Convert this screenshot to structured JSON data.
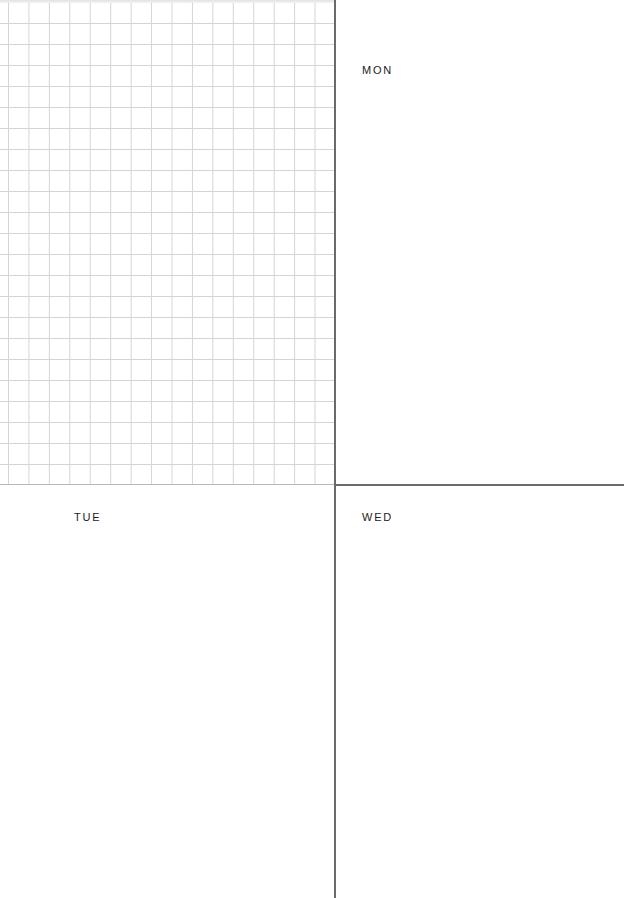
{
  "planner": {
    "notes_grid": {
      "columns": 16,
      "rows": 23,
      "line_color": "#d4d4d4"
    },
    "days": [
      {
        "label": "MON"
      },
      {
        "label": "TUE"
      },
      {
        "label": "WED"
      }
    ],
    "divider_color": "#6a6a6a"
  }
}
